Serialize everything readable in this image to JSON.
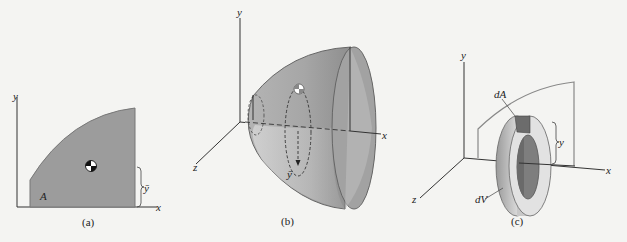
{
  "figure": {
    "panels": [
      {
        "id": "a",
        "caption": "(a)",
        "axis_labels": {
          "x": "x",
          "y": "y"
        },
        "region_label": "A",
        "centroid_distance_label": "ȳ",
        "description": "Plane area A with centroid, distance ȳ from x-axis"
      },
      {
        "id": "b",
        "caption": "(b)",
        "axis_labels": {
          "x": "x",
          "y": "y",
          "z": "z"
        },
        "centroid_path_label": "ȳ",
        "description": "Solid of revolution generated by rotating area about x-axis; centroid travels circular path"
      },
      {
        "id": "c",
        "caption": "(c)",
        "axis_labels": {
          "x": "x",
          "y": "y",
          "z": "z"
        },
        "element_area_label": "dA",
        "element_volume_label": "dV",
        "distance_label": "y",
        "description": "Ring volume element dV generated by area element dA at distance y"
      }
    ],
    "colors": {
      "background": "#f4f4f2",
      "shade": "#9c9c9c",
      "shade_dark": "#808080",
      "shade_light": "#d8d8d8",
      "outline": "#555555",
      "axis": "#333333"
    }
  }
}
